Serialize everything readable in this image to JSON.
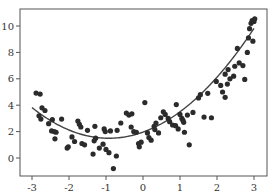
{
  "chart_data": {
    "type": "scatter",
    "title": "",
    "xlabel": "",
    "ylabel": "",
    "xlim": [
      -3.3,
      3.35
    ],
    "ylim": [
      -1.4,
      11.2
    ],
    "grid": false,
    "legend": null,
    "x_ticks": [
      -3,
      -2,
      -1,
      0,
      1,
      2,
      3
    ],
    "x_tick_labels": [
      "-3",
      "-2",
      "-1",
      "0",
      "1",
      "2",
      "3"
    ],
    "y_ticks": [
      0,
      2,
      4,
      6,
      8,
      10
    ],
    "y_tick_labels": [
      "0",
      "2",
      "4",
      "6",
      "8",
      "10"
    ],
    "colors": {
      "points": "#2b2b2b",
      "curve": "#444444",
      "axes": "#555555",
      "background": "#ffffff"
    },
    "fit_curve": {
      "type": "quadratic",
      "coefficients": {
        "a": 0.54,
        "b": 1.0,
        "c": 1.96
      },
      "x_range": [
        -3,
        3
      ]
    },
    "series": [
      {
        "name": "data",
        "points": [
          [
            -2.89,
            4.92
          ],
          [
            -2.78,
            4.84
          ],
          [
            -2.81,
            3.2
          ],
          [
            -2.76,
            2.95
          ],
          [
            -2.73,
            3.8
          ],
          [
            -2.65,
            3.6
          ],
          [
            -2.55,
            2.6
          ],
          [
            -2.45,
            2.9
          ],
          [
            -2.47,
            2.05
          ],
          [
            -2.4,
            2.0
          ],
          [
            -2.35,
            1.95
          ],
          [
            -2.38,
            1.45
          ],
          [
            -2.2,
            2.95
          ],
          [
            -2.02,
            0.85
          ],
          [
            -2.05,
            0.75
          ],
          [
            -1.92,
            1.6
          ],
          [
            -1.85,
            1.25
          ],
          [
            -1.76,
            2.8
          ],
          [
            -1.72,
            2.55
          ],
          [
            -1.68,
            2.35
          ],
          [
            -1.65,
            1.1
          ],
          [
            -1.58,
            1.0
          ],
          [
            -1.5,
            2.1
          ],
          [
            -1.3,
            2.4
          ],
          [
            -1.28,
            1.5
          ],
          [
            -1.32,
            1.3
          ],
          [
            -1.35,
            0.3
          ],
          [
            -1.18,
            0.75
          ],
          [
            -1.05,
            2.2
          ],
          [
            -1.02,
            2.0
          ],
          [
            -1.08,
            1.05
          ],
          [
            -1.0,
            0.65
          ],
          [
            -0.92,
            0.4
          ],
          [
            -0.88,
            2.05
          ],
          [
            -0.8,
            -0.8
          ],
          [
            -0.72,
            0.15
          ],
          [
            -0.7,
            2.1
          ],
          [
            -0.6,
            2.65
          ],
          [
            -0.45,
            3.4
          ],
          [
            -0.38,
            3.25
          ],
          [
            -0.3,
            3.35
          ],
          [
            -0.32,
            2.35
          ],
          [
            -0.25,
            2.0
          ],
          [
            -0.18,
            1.95
          ],
          [
            -0.12,
            1.1
          ],
          [
            -0.1,
            0.85
          ],
          [
            -0.05,
            1.2
          ],
          [
            0.05,
            4.2
          ],
          [
            0.12,
            1.9
          ],
          [
            0.16,
            1.55
          ],
          [
            0.22,
            1.35
          ],
          [
            0.3,
            2.4
          ],
          [
            0.32,
            2.15
          ],
          [
            0.35,
            2.65
          ],
          [
            0.42,
            1.9
          ],
          [
            0.48,
            3.05
          ],
          [
            0.6,
            3.3
          ],
          [
            0.68,
            3.0
          ],
          [
            0.72,
            2.75
          ],
          [
            0.8,
            2.5
          ],
          [
            0.88,
            2.45
          ],
          [
            0.95,
            2.2
          ],
          [
            1.0,
            3.3
          ],
          [
            1.05,
            3.0
          ],
          [
            1.08,
            2.85
          ],
          [
            1.1,
            2.7
          ],
          [
            1.12,
            1.95
          ],
          [
            1.2,
            3.25
          ],
          [
            1.25,
            1.0
          ],
          [
            1.35,
            3.45
          ],
          [
            1.5,
            4.55
          ],
          [
            1.55,
            4.8
          ],
          [
            1.75,
            4.9
          ],
          [
            1.85,
            3.05
          ],
          [
            1.98,
            5.8
          ],
          [
            2.1,
            5.5
          ],
          [
            2.15,
            5.0
          ],
          [
            2.22,
            6.35
          ],
          [
            2.28,
            5.6
          ],
          [
            2.3,
            6.7
          ],
          [
            2.35,
            6.0
          ],
          [
            2.45,
            6.2
          ],
          [
            2.55,
            8.3
          ],
          [
            2.6,
            7.2
          ],
          [
            2.48,
            6.95
          ],
          [
            2.7,
            7.0
          ],
          [
            2.75,
            5.95
          ],
          [
            2.82,
            8.0
          ],
          [
            2.88,
            9.8
          ],
          [
            2.92,
            10.2
          ],
          [
            2.95,
            10.4
          ],
          [
            3.0,
            10.35
          ],
          [
            3.02,
            10.55
          ],
          [
            2.97,
            8.85
          ],
          [
            2.85,
            9.1
          ],
          [
            2.22,
            4.6
          ],
          [
            1.65,
            3.1
          ],
          [
            0.9,
            4.05
          ],
          [
            0.55,
            3.5
          ]
        ]
      }
    ]
  }
}
